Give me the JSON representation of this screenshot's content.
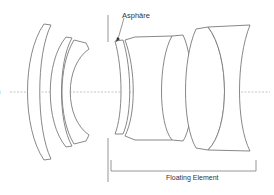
{
  "diagram": {
    "type": "lens-cross-section",
    "labels": {
      "asphere": "Asphäre",
      "floating_element": "Floating Element",
      "left_cutoff": "h",
      "left_cutoff_2": "-"
    },
    "colors": {
      "lens_stroke": "#7a7a7a",
      "axis": "#b5b5b5",
      "text": "#333333",
      "background": "#ffffff"
    },
    "elements": [
      {
        "id": 1,
        "kind": "meniscus"
      },
      {
        "id": 2,
        "kind": "meniscus"
      },
      {
        "id": 3,
        "kind": "meniscus"
      },
      {
        "id": 4,
        "kind": "asphere-meniscus"
      },
      {
        "id": 5,
        "kind": "cemented-doublet"
      },
      {
        "id": 6,
        "kind": "cemented-doublet"
      }
    ]
  }
}
